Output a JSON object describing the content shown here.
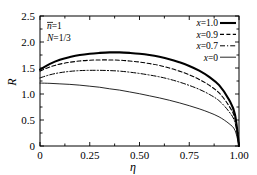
{
  "chart_data": {
    "type": "line",
    "title": "",
    "xlabel": "η",
    "ylabel": "R",
    "xlim": [
      0,
      1.0
    ],
    "ylim": [
      0,
      2.5
    ],
    "grid": false,
    "legend_position": "top-right",
    "xticks": [
      "0",
      "0.25",
      "0.50",
      "0.75",
      "1.00"
    ],
    "xtick_values": [
      0,
      0.25,
      0.5,
      0.75,
      1.0
    ],
    "yticks": [
      "0",
      "0.5",
      "1.0",
      "1.5",
      "2.0",
      "2.5"
    ],
    "ytick_values": [
      0,
      0.5,
      1.0,
      1.5,
      2.0,
      2.5
    ],
    "annotations": [
      {
        "text": "n̄=1",
        "symbol": "n",
        "overbar": true,
        "value": "1"
      },
      {
        "text": "N=1/3",
        "symbol": "N",
        "value": "1/3"
      }
    ],
    "x": [
      0,
      0.05,
      0.1,
      0.15,
      0.2,
      0.25,
      0.3,
      0.35,
      0.4,
      0.45,
      0.5,
      0.55,
      0.6,
      0.65,
      0.7,
      0.75,
      0.8,
      0.85,
      0.9,
      0.95,
      0.98,
      1.0
    ],
    "series": [
      {
        "name": "x=1.0",
        "label": "x=1.0",
        "style": "solid",
        "width": 2.1,
        "color": "#000000",
        "values": [
          1.47,
          1.58,
          1.66,
          1.71,
          1.75,
          1.775,
          1.79,
          1.8,
          1.8,
          1.79,
          1.775,
          1.75,
          1.715,
          1.67,
          1.61,
          1.54,
          1.45,
          1.33,
          1.17,
          0.89,
          0.6,
          0.0
        ]
      },
      {
        "name": "x=0.9",
        "label": "x=0.9",
        "style": "dashed",
        "width": 1.1,
        "color": "#000000",
        "values": [
          1.44,
          1.52,
          1.575,
          1.61,
          1.635,
          1.65,
          1.655,
          1.655,
          1.65,
          1.635,
          1.615,
          1.585,
          1.55,
          1.5,
          1.44,
          1.37,
          1.28,
          1.17,
          1.02,
          0.77,
          0.52,
          0.0
        ]
      },
      {
        "name": "x=0.7",
        "label": "x=0.7",
        "style": "dashdot",
        "width": 1.0,
        "color": "#000000",
        "values": [
          1.31,
          1.37,
          1.41,
          1.435,
          1.45,
          1.455,
          1.455,
          1.45,
          1.44,
          1.42,
          1.395,
          1.365,
          1.33,
          1.285,
          1.23,
          1.165,
          1.09,
          0.995,
          0.87,
          0.66,
          0.45,
          0.0
        ]
      },
      {
        "name": "x=0",
        "label": "x=0",
        "style": "solid",
        "width": 0.85,
        "color": "#000000",
        "values": [
          1.21,
          1.205,
          1.195,
          1.185,
          1.17,
          1.15,
          1.13,
          1.1,
          1.075,
          1.04,
          1.005,
          0.965,
          0.925,
          0.88,
          0.83,
          0.775,
          0.715,
          0.645,
          0.56,
          0.43,
          0.3,
          0.0
        ]
      }
    ]
  },
  "legend": {
    "entries": [
      {
        "label": "x=1.0",
        "style": "solid",
        "width": 2.1
      },
      {
        "label": "x=0.9",
        "style": "dashed",
        "width": 1.1
      },
      {
        "label": "x=0.7",
        "style": "dashdot",
        "width": 1.0
      },
      {
        "label": "x=0",
        "style": "solid",
        "width": 0.85
      }
    ]
  }
}
